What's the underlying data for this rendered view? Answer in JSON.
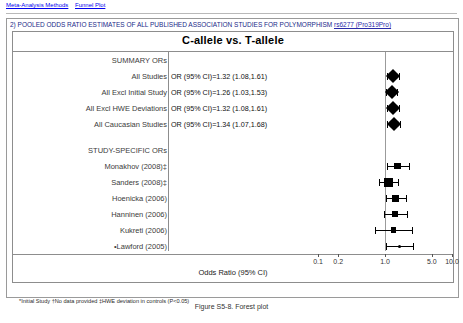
{
  "topbar": {
    "tabs": [
      {
        "label": "Meta-Analysis Methods"
      },
      {
        "label": "Funnel Plot"
      }
    ]
  },
  "panel": {
    "title_prefix": "2) POOLED ODDS RATIO ESTIMATES OF ALL PUBLISHED ASSOCIATION STUDIES FOR POLYMORPHISM ",
    "title_link": "rs6277 (Pro319Pro)"
  },
  "footnote": "*Initial Study   †No data provided   ‡HWE deviation in controls (P<0.05)",
  "caption": "Figure S5-8. Forest plot",
  "chart_data": {
    "type": "forest",
    "title": "C-allele vs. T-allele",
    "xlabel": "Odds Ratio (95% CI)",
    "xscale": "log",
    "xlim": [
      0.1,
      10.0
    ],
    "xticks": [
      0.1,
      0.2,
      1.0,
      5.0,
      10.0
    ],
    "xticklabels": [
      "0.1",
      "0.2",
      "1.0",
      "5.0",
      "10.0"
    ],
    "reference_line": 1.0,
    "grid": false,
    "groups": [
      {
        "header": "SUMMARY ORs",
        "rows": [
          {
            "label": "All Studies",
            "stat": "OR (95% CI)=1.32 (1.08,1.61)",
            "or": 1.32,
            "lcl": 1.08,
            "ucl": 1.61,
            "marker": "diamond"
          },
          {
            "label": "All Excl Initial Study",
            "stat": "OR (95% CI)=1.26 (1.03,1.53)",
            "or": 1.26,
            "lcl": 1.03,
            "ucl": 1.53,
            "marker": "diamond"
          },
          {
            "label": "All Excl HWE Deviations",
            "stat": "OR (95% CI)=1.32 (1.08,1.61)",
            "or": 1.32,
            "lcl": 1.08,
            "ucl": 1.61,
            "marker": "diamond"
          },
          {
            "label": "All Caucasian Studies",
            "stat": "OR (95% CI)=1.34 (1.07,1.68)",
            "or": 1.34,
            "lcl": 1.07,
            "ucl": 1.68,
            "marker": "diamond"
          }
        ]
      },
      {
        "header": "STUDY-SPECIFIC ORs",
        "rows": [
          {
            "label": "Monakhov (2008)‡",
            "stat": "",
            "or": 1.55,
            "lcl": 1.07,
            "ucl": 2.25,
            "marker": "square",
            "weight": 0.55
          },
          {
            "label": "Sanders (2008)‡",
            "stat": "",
            "or": 1.12,
            "lcl": 0.82,
            "ucl": 1.55,
            "marker": "square",
            "weight": 1.0
          },
          {
            "label": "Hoenicka (2006)",
            "stat": "",
            "or": 1.45,
            "lcl": 1.04,
            "ucl": 2.05,
            "marker": "square",
            "weight": 0.6
          },
          {
            "label": "Hanninen (2006)",
            "stat": "",
            "or": 1.42,
            "lcl": 0.96,
            "ucl": 2.1,
            "marker": "square",
            "weight": 0.45
          },
          {
            "label": "Kukreti (2006)",
            "stat": "",
            "or": 1.35,
            "lcl": 0.72,
            "ucl": 2.55,
            "marker": "square",
            "weight": 0.3
          },
          {
            "label": "•Lawford (2005)",
            "stat": "",
            "or": 1.62,
            "lcl": 1.02,
            "ucl": 2.6,
            "marker": "dot",
            "weight": 0.2
          }
        ]
      }
    ]
  }
}
